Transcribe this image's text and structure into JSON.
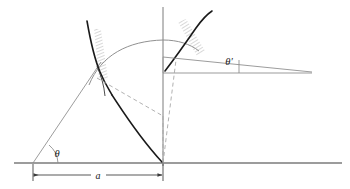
{
  "figure": {
    "background_color": "#ffffff",
    "width": 350,
    "height": 189,
    "labels": {
      "launch_angle": "θ",
      "impact_angle": "θ′",
      "range_dimension": "a"
    },
    "colors": {
      "baseline": "#3a3a3a",
      "thin_line": "#8a8a8a",
      "thick_curve": "#1a1a1a",
      "dashed_line": "#a8a8a8",
      "hatch": "#9a9a9a",
      "axis": "#6e6e6e",
      "text": "#1a1a1a"
    },
    "geometry": {
      "baseline_y": 163,
      "vertical_axis_x": 163,
      "origin_x": 33,
      "impact_x": 163,
      "apex_x": 163,
      "apex_y": 42,
      "range_label_x": 98,
      "dimension_line_y": 175
    },
    "elements": [
      "baseline",
      "vertical-axis",
      "trajectory-arc",
      "launch-ray",
      "left-wavefront-curve",
      "right-wavefront-curve",
      "left-hatch-band",
      "right-hatch-band",
      "dashed-chord",
      "dashed-radius",
      "impact-horizontal",
      "impact-sloped-ray",
      "angle-theta-arc",
      "angle-theta-prime-marker",
      "range-dimension-line"
    ]
  }
}
